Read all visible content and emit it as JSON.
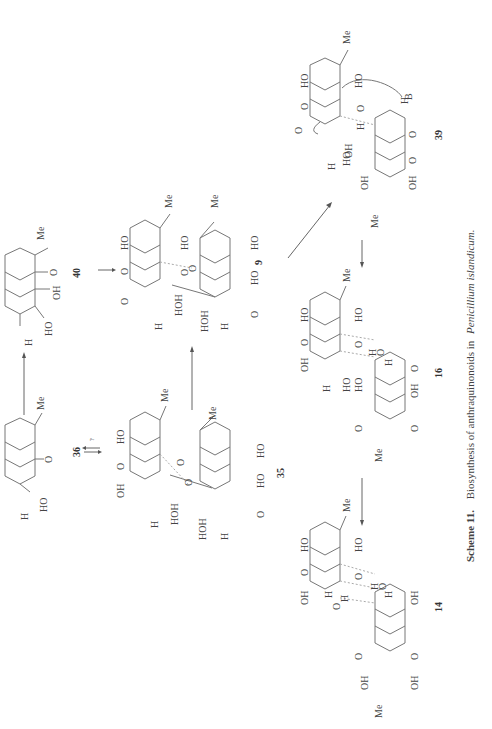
{
  "caption": {
    "scheme_label": "Scheme 11.",
    "text": "Biosynthesis of anthraquinonoids in",
    "organism": "Penicillium islandicum."
  },
  "compounds": [
    {
      "id": "36",
      "label": "36"
    },
    {
      "id": "40",
      "label": "40"
    },
    {
      "id": "35",
      "label": "35"
    },
    {
      "id": "9",
      "label": "9"
    },
    {
      "id": "16",
      "label": "16"
    },
    {
      "id": "14",
      "label": "14"
    },
    {
      "id": "39",
      "label": "39"
    }
  ],
  "atoms": {
    "me": "Me",
    "ho": "HO",
    "oh": "OH",
    "o": "O",
    "h": "H",
    "hoh": "HOH",
    "b": "B"
  },
  "arrows": [
    {
      "from": "36",
      "to": "40",
      "type": "forward"
    },
    {
      "from": "36",
      "to": "35",
      "type": "equilibrium",
      "annotation": "?"
    },
    {
      "from": "40",
      "to": "9",
      "type": "forward"
    },
    {
      "from": "35",
      "to": "9",
      "type": "forward"
    },
    {
      "from": "9",
      "to": "39",
      "type": "forward"
    },
    {
      "from": "39",
      "to": "16",
      "type": "forward"
    },
    {
      "from": "16",
      "to": "14",
      "type": "forward"
    }
  ],
  "equilibrium_annotation": "?"
}
